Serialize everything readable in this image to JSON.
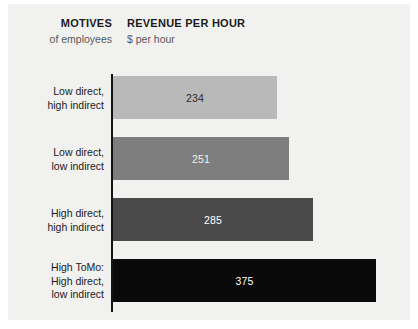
{
  "panel": {
    "background": "#f1f1f0"
  },
  "header": {
    "motives_title": "MOTIVES",
    "motives_sub": "of employees",
    "revenue_title": "REVENUE PER HOUR",
    "revenue_sub": "$ per hour"
  },
  "chart_data": {
    "type": "bar",
    "orientation": "horizontal",
    "title": "REVENUE PER HOUR",
    "subtitle": "$ per hour",
    "xlabel": "$ per hour",
    "ylabel": "MOTIVES of employees",
    "grid": false,
    "legend": false,
    "xlim": [
      0,
      375
    ],
    "categories": [
      "Low direct, high indirect",
      "Low direct, low indirect",
      "High direct, high indirect",
      "High ToMo: High direct, low indirect"
    ],
    "values": [
      234,
      251,
      285,
      375
    ],
    "bars": [
      {
        "label_lines": [
          "Low direct,",
          "high indirect"
        ],
        "value": 234,
        "value_text": "234",
        "color": "#b9b9b9",
        "value_color": "#2a2a2a"
      },
      {
        "label_lines": [
          "Low direct,",
          "low indirect"
        ],
        "value": 251,
        "value_text": "251",
        "color": "#7e7e7e",
        "value_color": "#f2f2f2"
      },
      {
        "label_lines": [
          "High direct,",
          "high indirect"
        ],
        "value": 285,
        "value_text": "285",
        "color": "#4a4a4a",
        "value_color": "#ffffff"
      },
      {
        "label_lines": [
          "High ToMo:",
          "High direct,",
          "low indirect"
        ],
        "value": 375,
        "value_text": "375",
        "color": "#0a0a0a",
        "value_color": "#ffffff"
      }
    ]
  }
}
